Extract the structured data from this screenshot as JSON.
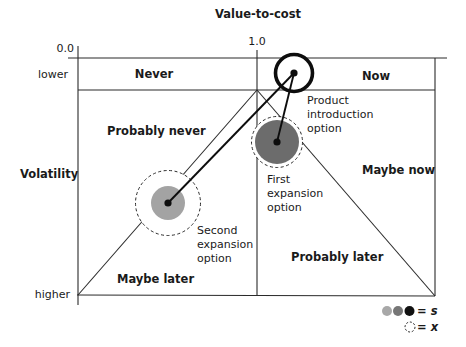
{
  "x_axis": {
    "label": "Value-to-cost",
    "ticks": [
      "0.0",
      "1.0"
    ]
  },
  "y_axis": {
    "label": "Volatility",
    "ticks": [
      "lower",
      "higher"
    ]
  },
  "regions": {
    "never": "Never",
    "now": "Now",
    "probably_never": "Probably never",
    "maybe_now": "Maybe now",
    "maybe_later": "Maybe later",
    "probably_later": "Probably later"
  },
  "options": [
    {
      "label_lines": [
        "Product",
        "introduction",
        "option"
      ],
      "fill": "#ffffff",
      "ring": "solid"
    },
    {
      "label_lines": [
        "First",
        "expansion",
        "option"
      ],
      "fill": "#6c6c6c",
      "ring": "dashed"
    },
    {
      "label_lines": [
        "Second",
        "expansion",
        "option"
      ],
      "fill": "#a3a3a3",
      "ring": "dashed"
    }
  ],
  "legend": {
    "s_label": "= s",
    "x_label": "= x",
    "s_colors": [
      "#a8a8a8",
      "#767676",
      "#111111"
    ]
  },
  "colors": {
    "light_gray": "#a3a3a3",
    "dark_gray": "#6c6c6c",
    "black": "#0d0d0d"
  }
}
